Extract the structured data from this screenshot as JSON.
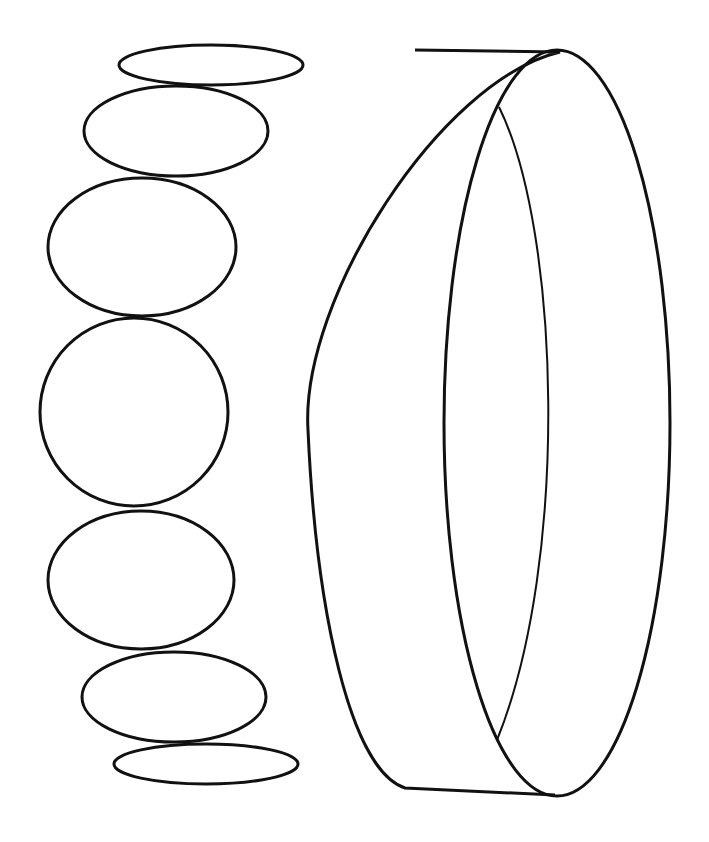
{
  "drawing": {
    "description": "Line drawing: stacked ellipses (rotating disc views) and a ring/cylinder",
    "stroke_color": "#111111",
    "background_color": "#ffffff",
    "ellipses": [
      {
        "cx": 211,
        "cy": 65,
        "rx": 92,
        "ry": 20
      },
      {
        "cx": 176,
        "cy": 131,
        "rx": 92,
        "ry": 45
      },
      {
        "cx": 142,
        "cy": 247,
        "rx": 94,
        "ry": 69
      },
      {
        "cx": 134,
        "cy": 412,
        "rx": 94,
        "ry": 94
      },
      {
        "cx": 141,
        "cy": 580,
        "rx": 93,
        "ry": 69
      },
      {
        "cx": 174,
        "cy": 697,
        "rx": 92,
        "ry": 45
      },
      {
        "cx": 206,
        "cy": 764,
        "rx": 92,
        "ry": 20
      }
    ],
    "ring": {
      "outer_path": "M 415 50 L 560 52 C 440 80 300 300 308 430 C 316 610 350 770 405 788 L 555 795",
      "front_ellipse": {
        "cx": 557,
        "cy": 423,
        "rx": 113,
        "ry": 373
      },
      "inner_back_path": "M 499 107 C 560 230 570 560 497 740"
    }
  }
}
